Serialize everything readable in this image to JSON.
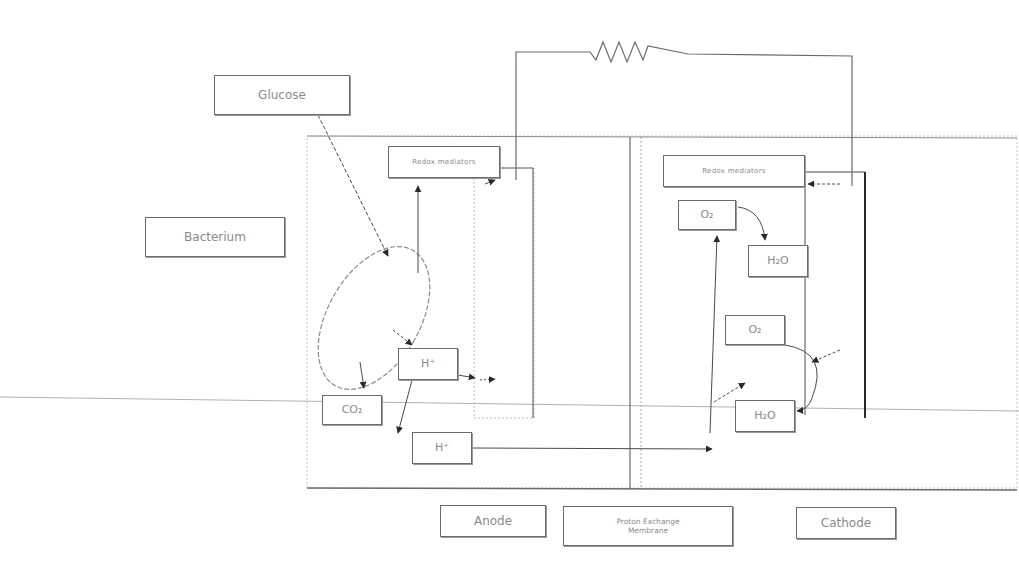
{
  "diagram": {
    "colors": {
      "line": "#6a6a6a",
      "dark_line": "#3a3a3a",
      "dashed": "#a8a8a8",
      "text": "#8a8a8a",
      "background": "#ffffff"
    },
    "labels": {
      "glucose": {
        "text": "Glucose",
        "x": 214,
        "y": 75,
        "w": 136,
        "h": 40,
        "cls": "mid"
      },
      "bacterium": {
        "text": "Bacterium",
        "x": 145,
        "y": 217,
        "w": 140,
        "h": 40,
        "cls": "mid"
      },
      "redox_anode": {
        "text": "Redox mediators",
        "x": 388,
        "y": 146,
        "w": 112,
        "h": 32,
        "cls": "small"
      },
      "redox_cathode": {
        "text": "Redox mediators",
        "x": 663,
        "y": 155,
        "w": 142,
        "h": 32,
        "cls": "small"
      },
      "o2_top": {
        "text": "O₂",
        "x": 678,
        "y": 200,
        "w": 58,
        "h": 30,
        "cls": ""
      },
      "h2o_top": {
        "text": "H₂O",
        "x": 748,
        "y": 245,
        "w": 60,
        "h": 32,
        "cls": ""
      },
      "o2_bottom": {
        "text": "O₂",
        "x": 725,
        "y": 315,
        "w": 60,
        "h": 30,
        "cls": ""
      },
      "h2o_bottom": {
        "text": "H₂O",
        "x": 735,
        "y": 400,
        "w": 60,
        "h": 32,
        "cls": ""
      },
      "h_plus_mid": {
        "text": "H⁺",
        "x": 398,
        "y": 348,
        "w": 60,
        "h": 32,
        "cls": ""
      },
      "co2": {
        "text": "CO₂",
        "x": 322,
        "y": 395,
        "w": 60,
        "h": 30,
        "cls": ""
      },
      "h_plus_low": {
        "text": "H⁺",
        "x": 412,
        "y": 432,
        "w": 60,
        "h": 32,
        "cls": ""
      },
      "anode": {
        "text": "Anode",
        "x": 440,
        "y": 505,
        "w": 106,
        "h": 32,
        "cls": "mid"
      },
      "pem": {
        "text": "Proton Exchange\nMembrane",
        "x": 563,
        "y": 506,
        "w": 170,
        "h": 40,
        "cls": "tiny"
      },
      "cathode": {
        "text": "Cathode",
        "x": 796,
        "y": 507,
        "w": 100,
        "h": 32,
        "cls": "mid"
      }
    },
    "components": {
      "resistor": "external-load-resistor",
      "chamber": "fuel-cell-chamber",
      "membrane": "proton-exchange-membrane",
      "anode_electrode": "anode-electrode",
      "cathode_electrode": "cathode-electrode",
      "cell": "bacterium-cell"
    }
  }
}
